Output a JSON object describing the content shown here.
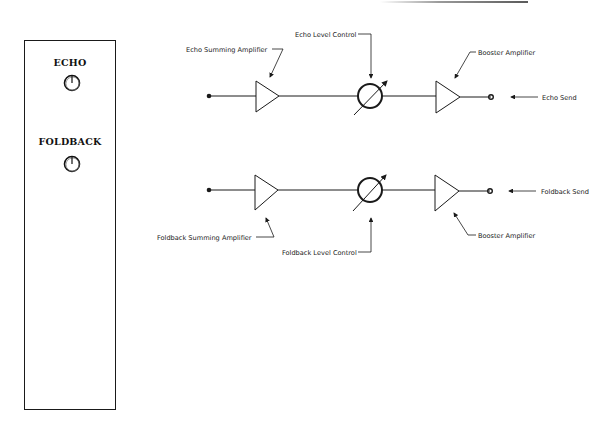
{
  "panel": {
    "controls": [
      {
        "label": "ECHO",
        "icon": "rotary-knob-icon"
      },
      {
        "label": "FOLDBACK",
        "icon": "rotary-knob-icon"
      }
    ]
  },
  "diagram": {
    "echo_chain": {
      "summing_amp_label": "Echo Summing Amplifier",
      "level_control_label": "Echo Level Control",
      "booster_amp_label": "Booster Amplifier",
      "output_label": "Echo Send"
    },
    "foldback_chain": {
      "summing_amp_label": "Foldback Summing Amplifier",
      "level_control_label": "Foldback Level Control",
      "booster_amp_label": "Booster Amplifier",
      "output_label": "Foldback Send"
    },
    "colors": {
      "line": "#1a1a1a",
      "background": "#ffffff"
    }
  }
}
